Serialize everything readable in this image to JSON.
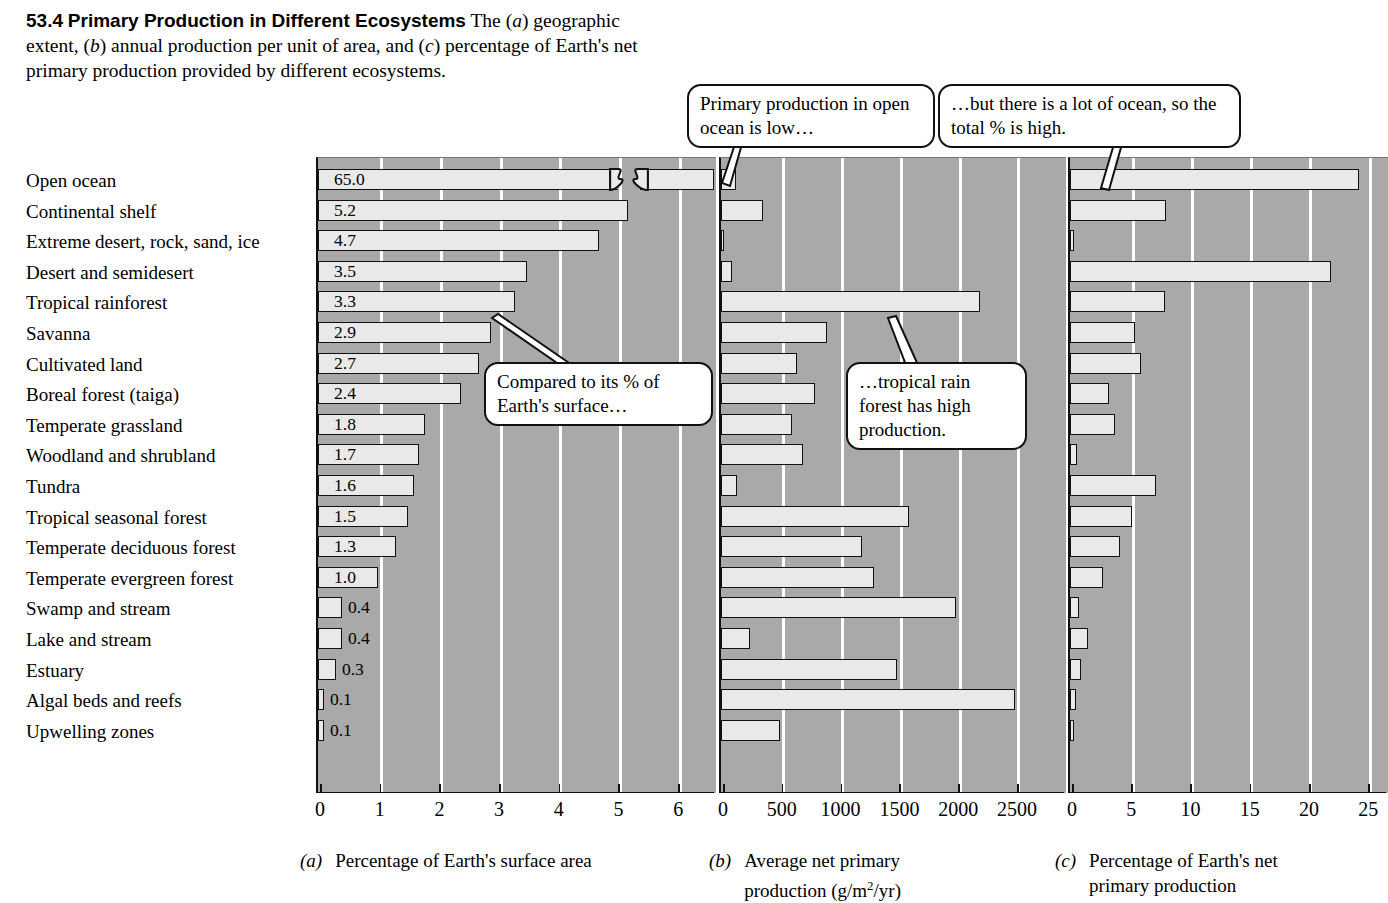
{
  "figure": {
    "number": "53.4",
    "title": "Primary Production in Different Ecosystems",
    "caption_part1": "The (",
    "caption": "The (a) geographic extent, (b) annual production per unit of area, and (c) percentage of Earth's net primary production provided by different ecosystems.",
    "caption_segments": {
      "s1": "The (",
      "a": "a",
      "s2": ") geographic extent, (",
      "b": "b",
      "s3": ") annual production per unit of area, and (",
      "c": "c",
      "s4": ") percentage of Earth's net primary production provided by different ecosystems."
    }
  },
  "callouts": [
    {
      "id": "open-ocean-low",
      "text": "Primary production in open ocean is low…"
    },
    {
      "id": "lot-of-ocean",
      "text": "…but there is a lot of ocean, so the total % is high."
    },
    {
      "id": "compared-to-surface",
      "text": "Compared to its % of Earth's surface…"
    },
    {
      "id": "rainforest-high",
      "text": "…tropical rain forest has high production."
    }
  ],
  "ecosystems": [
    "Open ocean",
    "Continental shelf",
    "Extreme desert, rock, sand, ice",
    "Desert and semidesert",
    "Tropical rainforest",
    "Savanna",
    "Cultivated land",
    "Boreal forest (taiga)",
    "Temperate grassland",
    "Woodland and shrubland",
    "Tundra",
    "Tropical seasonal forest",
    "Temperate deciduous forest",
    "Temperate evergreen forest",
    "Swamp and stream",
    "Lake and stream",
    "Estuary",
    "Algal beds and reefs",
    "Upwelling zones"
  ],
  "chart_data": [
    {
      "id": "a",
      "type": "bar",
      "orientation": "horizontal",
      "panel_label": "(a)",
      "title": "Percentage of Earth's surface area",
      "xlabel": "Percentage of Earth's surface area",
      "ylabel": "",
      "xlim": [
        0,
        6.6
      ],
      "ticks": [
        0,
        1,
        2,
        3,
        4,
        5,
        6
      ],
      "tick_labels": [
        "0",
        "1",
        "2",
        "3",
        "4",
        "5",
        "6"
      ],
      "grid": true,
      "axis_break": {
        "present": true,
        "row": "Open ocean",
        "note": "bar broken; true value 65.0 plotted off scale"
      },
      "data_labels": [
        "65.0",
        "5.2",
        "4.7",
        "3.5",
        "3.3",
        "2.9",
        "2.7",
        "2.4",
        "1.8",
        "1.7",
        "1.6",
        "1.5",
        "1.3",
        "1.0",
        "0.4",
        "0.4",
        "0.3",
        "0.1",
        "0.1"
      ],
      "categories": [
        "Open ocean",
        "Continental shelf",
        "Extreme desert, rock, sand, ice",
        "Desert and semidesert",
        "Tropical rainforest",
        "Savanna",
        "Cultivated land",
        "Boreal forest (taiga)",
        "Temperate grassland",
        "Woodland and shrubland",
        "Tundra",
        "Tropical seasonal forest",
        "Temperate deciduous forest",
        "Temperate evergreen forest",
        "Swamp and stream",
        "Lake and stream",
        "Estuary",
        "Algal beds and reefs",
        "Upwelling zones"
      ],
      "values": [
        65.0,
        5.2,
        4.7,
        3.5,
        3.3,
        2.9,
        2.7,
        2.4,
        1.8,
        1.7,
        1.6,
        1.5,
        1.3,
        1.0,
        0.4,
        0.4,
        0.3,
        0.1,
        0.1
      ]
    },
    {
      "id": "b",
      "type": "bar",
      "orientation": "horizontal",
      "panel_label": "(b)",
      "title": "Average net primary production (g/m2/yr)",
      "xlabel": "Average net primary production (g/m2/yr)",
      "ylabel": "",
      "xlim": [
        0,
        2900
      ],
      "ticks": [
        0,
        500,
        1000,
        1500,
        2000,
        2500
      ],
      "tick_labels": [
        "0",
        "500",
        "1000",
        "1500",
        "2000",
        "2500"
      ],
      "grid": true,
      "units": "g/m2/yr",
      "categories": [
        "Open ocean",
        "Continental shelf",
        "Extreme desert, rock, sand, ice",
        "Desert and semidesert",
        "Tropical rainforest",
        "Savanna",
        "Cultivated land",
        "Boreal forest (taiga)",
        "Temperate grassland",
        "Woodland and shrubland",
        "Tundra",
        "Tropical seasonal forest",
        "Temperate deciduous forest",
        "Temperate evergreen forest",
        "Swamp and stream",
        "Lake and stream",
        "Estuary",
        "Algal beds and reefs",
        "Upwelling zones"
      ],
      "values": [
        125,
        360,
        3,
        90,
        2200,
        900,
        650,
        800,
        600,
        700,
        140,
        1600,
        1200,
        1300,
        2000,
        250,
        1500,
        2500,
        500
      ]
    },
    {
      "id": "c",
      "type": "bar",
      "orientation": "horizontal",
      "panel_label": "(c)",
      "title": "Percentage of Earth's net primary production",
      "xlabel": "Percentage of Earth's net primary production",
      "ylabel": "",
      "xlim": [
        0,
        26.5
      ],
      "ticks": [
        0,
        5,
        10,
        15,
        20,
        25
      ],
      "tick_labels": [
        "0",
        "5",
        "10",
        "15",
        "20",
        "25"
      ],
      "grid": true,
      "categories": [
        "Open ocean",
        "Continental shelf",
        "Extreme desert, rock, sand, ice",
        "Desert and semidesert",
        "Tropical rainforest",
        "Savanna",
        "Cultivated land",
        "Boreal forest (taiga)",
        "Temperate grassland",
        "Woodland and shrubland",
        "Tundra",
        "Tropical seasonal forest",
        "Temperate deciduous forest",
        "Temperate evergreen forest",
        "Swamp and stream",
        "Lake and stream",
        "Estuary",
        "Algal beds and reefs",
        "Upwelling zones"
      ],
      "values": [
        24.4,
        8.1,
        0.3,
        22.0,
        8.0,
        5.5,
        6.0,
        3.3,
        3.8,
        0.6,
        7.3,
        5.2,
        4.2,
        2.8,
        0.8,
        1.5,
        0.9,
        0.5,
        0.3
      ]
    }
  ],
  "subcaptions": {
    "a": {
      "label": "(a)",
      "text": "Percentage of Earth's surface area"
    },
    "b": {
      "label": "(b)",
      "text_line1": "Average net primary",
      "text_pre": "production (g/m",
      "text_sup": "2",
      "text_post": "/yr)"
    },
    "c": {
      "label": "(c)",
      "text_line1": "Percentage of Earth's net",
      "text_line2": "primary production"
    }
  },
  "colors": {
    "panel_background": "#a9a9a9",
    "gridline": "#ffffff",
    "bar_fill": "#e9e9e9",
    "bar_outline": "#111111",
    "text": "#000000",
    "callout_background": "#ffffff"
  }
}
